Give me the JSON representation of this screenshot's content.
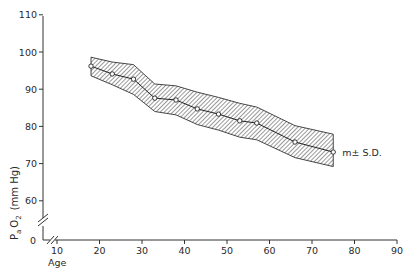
{
  "chart_data": {
    "type": "line",
    "title": "",
    "xlabel": "Age",
    "ylabel": "P_a O_2 (mm Hg)",
    "ylabel_parts": {
      "p": "P",
      "sub_a": "a",
      "o": "O",
      "sub_2": "2",
      "unit": "(mm Hg)"
    },
    "x_ticks": [
      10,
      20,
      30,
      40,
      50,
      60,
      70,
      80,
      90
    ],
    "y_ticks": [
      110,
      100,
      90,
      80,
      70,
      60
    ],
    "y_origin_label": "0",
    "xlim": [
      10,
      90
    ],
    "ylim": [
      55,
      110
    ],
    "axis_break": {
      "x": true,
      "y": true
    },
    "grid": false,
    "legend": {
      "label": "m± S.D.",
      "position": "right-end-of-series"
    },
    "series": [
      {
        "name": "mean",
        "x": [
          18,
          23,
          28,
          33,
          38,
          43,
          48,
          53,
          57,
          66,
          75
        ],
        "values": [
          96.2,
          94.1,
          92.7,
          87.6,
          87.1,
          84.7,
          83.3,
          81.5,
          80.9,
          75.8,
          73.1
        ]
      },
      {
        "name": "upper (m + S.D.)",
        "x": [
          18,
          23,
          28,
          33,
          38,
          43,
          48,
          53,
          57,
          66,
          75
        ],
        "values": [
          98.6,
          97.3,
          96.6,
          91.4,
          90.9,
          89.2,
          87.8,
          86.2,
          85.2,
          80.2,
          77.9
        ]
      },
      {
        "name": "lower (m - S.D.)",
        "x": [
          18,
          23,
          28,
          33,
          38,
          43,
          48,
          53,
          57,
          66,
          75
        ],
        "values": [
          93.6,
          91.2,
          88.6,
          84.0,
          83.1,
          80.5,
          79.0,
          77.1,
          76.4,
          71.6,
          69.2
        ]
      }
    ]
  },
  "colors": {
    "line": "#222222",
    "band_hatch": "#333333",
    "background": "#ffffff"
  }
}
